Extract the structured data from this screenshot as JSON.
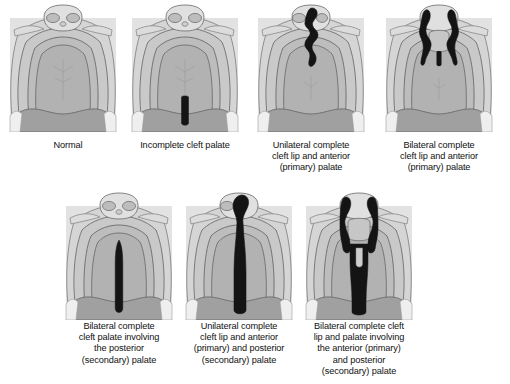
{
  "figure": {
    "palette": {
      "background": "#ffffff",
      "tissue_light": "#d8d8d8",
      "tissue_mid": "#c2c2c2",
      "tissue_dark": "#ababab",
      "tissue_darker": "#9a9a9a",
      "outline": "#6f6f6f",
      "cleft": "#111111",
      "caption_text": "#111111"
    },
    "panels": [
      {
        "id": "normal",
        "caption": "Normal",
        "cleft_type": "none",
        "row": 1,
        "column": 1
      },
      {
        "id": "incomplete",
        "caption": "Incomplete cleft palate",
        "cleft_type": "posterior-midline-short",
        "row": 1,
        "column": 2
      },
      {
        "id": "unilateral-lip",
        "caption": "Unilateral complete\ncleft lip and anterior\n(primary) palate",
        "cleft_type": "unilateral-anterior",
        "row": 1,
        "column": 3
      },
      {
        "id": "bilateral-lip",
        "caption": "Bilateral complete\ncleft lip and anterior\n(primary) palate",
        "cleft_type": "bilateral-anterior",
        "row": 1,
        "column": 4
      },
      {
        "id": "bilateral-palate",
        "caption": "Bilateral complete\ncleft palate involving\nthe posterior\n(secondary) palate",
        "cleft_type": "posterior-midline-long",
        "row": 2,
        "column": 1
      },
      {
        "id": "unilateral-full",
        "caption": "Unilateral complete\ncleft lip and anterior\n(primary) and posterior\n(secondary) palate",
        "cleft_type": "unilateral-anterior-posterior",
        "row": 2,
        "column": 2
      },
      {
        "id": "bilateral-full",
        "caption": "Bilateral complete cleft\nlip and palate involving\nthe anterior (primary)\nand posterior\n(secondary) palate",
        "cleft_type": "bilateral-anterior-posterior",
        "row": 2,
        "column": 3
      }
    ]
  }
}
